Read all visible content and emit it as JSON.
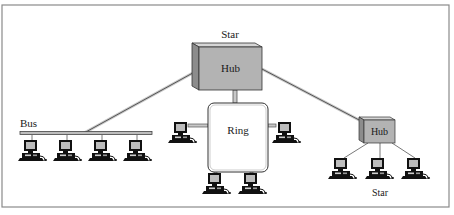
{
  "diagram": {
    "type": "network-topology",
    "frame": {
      "x": 2,
      "y": 5,
      "width": 447,
      "height": 202
    },
    "colors": {
      "hub_face": "#b3b3b3",
      "hub_side": "#8c8c8c",
      "hub_top": "#d6d6d6",
      "cable": "#555555",
      "cable_light": "#c8c8c8",
      "screen": "#bdbdbd",
      "computer_body": "#111111",
      "frame_border": "#8a8a8a"
    },
    "main_hub": {
      "label": "Hub",
      "topology_label": "Star",
      "x": 199,
      "y": 47,
      "width": 63,
      "height": 43,
      "depth": 8
    },
    "ring": {
      "label": "Ring",
      "x": 208,
      "y": 103,
      "width": 60,
      "height": 69,
      "radius": 6,
      "computers": [
        {
          "x": 172,
          "y": 122
        },
        {
          "x": 276,
          "y": 122
        },
        {
          "x": 206,
          "y": 173
        },
        {
          "x": 242,
          "y": 173
        }
      ]
    },
    "bus": {
      "label": "Bus",
      "x1": 20,
      "x2": 152,
      "y": 133,
      "computers": [
        {
          "x": 22,
          "y": 140
        },
        {
          "x": 57,
          "y": 140
        },
        {
          "x": 92,
          "y": 140
        },
        {
          "x": 127,
          "y": 140
        }
      ]
    },
    "star_hub": {
      "label": "Hub",
      "topology_label": "Star",
      "x": 364,
      "y": 120,
      "width": 31,
      "height": 23,
      "depth": 5,
      "computers": [
        {
          "x": 332,
          "y": 158
        },
        {
          "x": 369,
          "y": 158
        },
        {
          "x": 405,
          "y": 158
        }
      ]
    }
  }
}
